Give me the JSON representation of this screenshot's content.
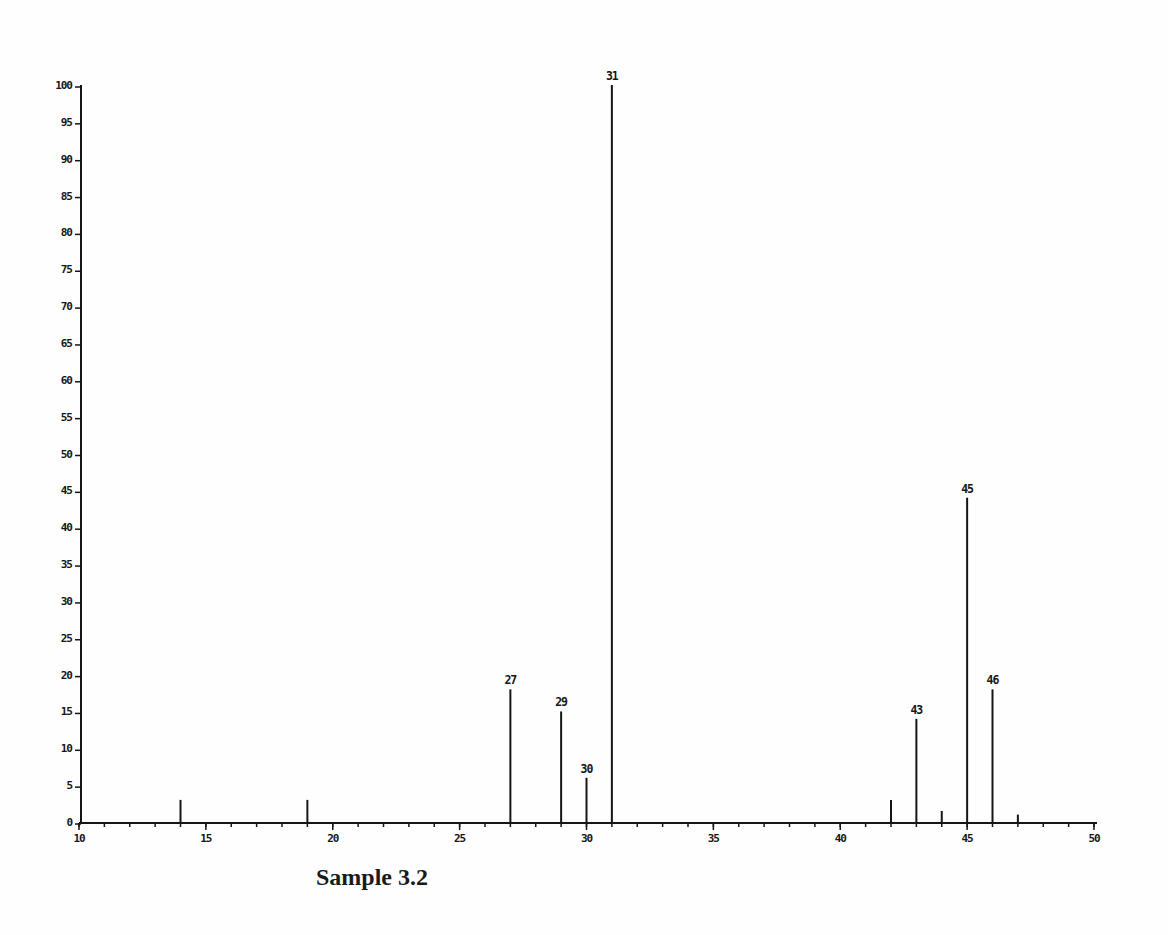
{
  "chart_data": {
    "type": "bar",
    "subtype": "mass-spectrum-stick-plot",
    "title": "Sample 3.2",
    "xlabel": "",
    "ylabel": "",
    "xlim": [
      10,
      50
    ],
    "ylim": [
      0,
      100
    ],
    "x_major_ticks": [
      10,
      15,
      20,
      25,
      30,
      35,
      40,
      45,
      50
    ],
    "x_minor_tick_step": 1,
    "y_ticks": [
      0,
      5,
      10,
      15,
      20,
      25,
      30,
      35,
      40,
      45,
      50,
      55,
      60,
      65,
      70,
      75,
      80,
      85,
      90,
      95,
      100
    ],
    "grid": false,
    "legend": false,
    "ink_color": "#161616",
    "background_color": "#fefefe",
    "peaks": [
      {
        "mz": 14,
        "intensity": 3,
        "label": ""
      },
      {
        "mz": 19,
        "intensity": 3,
        "label": ""
      },
      {
        "mz": 27,
        "intensity": 18,
        "label": "27"
      },
      {
        "mz": 29,
        "intensity": 15,
        "label": "29"
      },
      {
        "mz": 30,
        "intensity": 6,
        "label": "30"
      },
      {
        "mz": 31,
        "intensity": 100,
        "label": "31"
      },
      {
        "mz": 42,
        "intensity": 3,
        "label": ""
      },
      {
        "mz": 43,
        "intensity": 14,
        "label": "43"
      },
      {
        "mz": 44,
        "intensity": 1.5,
        "label": ""
      },
      {
        "mz": 45,
        "intensity": 44,
        "label": "45"
      },
      {
        "mz": 46,
        "intensity": 18,
        "label": "46"
      },
      {
        "mz": 47,
        "intensity": 1,
        "label": ""
      }
    ]
  }
}
